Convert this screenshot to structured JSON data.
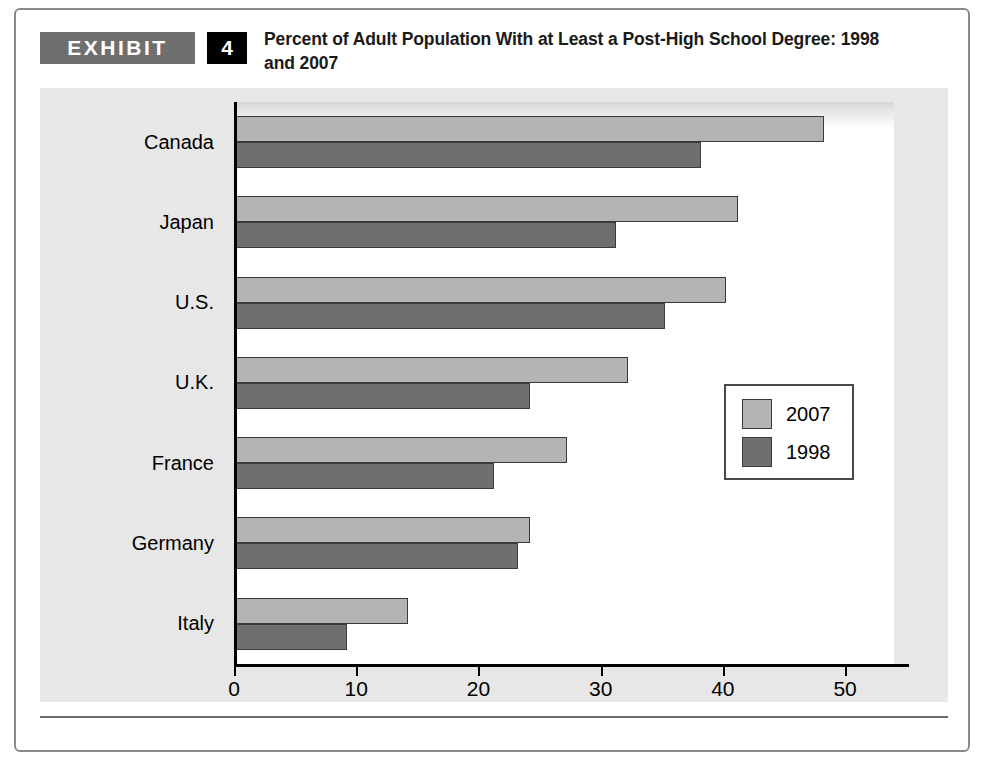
{
  "exhibit": {
    "label": "EXHIBIT",
    "number": "4",
    "title": "Percent of Adult Population With at Least a Post-High School Degree: 1998 and 2007"
  },
  "chart_data": {
    "type": "bar",
    "orientation": "horizontal",
    "title": "Percent of Adult Population With at Least a Post-High School Degree: 1998 and 2007",
    "xlabel": "",
    "ylabel": "",
    "xlim": [
      0,
      54
    ],
    "xticks": [
      0,
      10,
      20,
      30,
      40,
      50
    ],
    "xtick_labels": [
      "0",
      "10",
      "20",
      "30",
      "40",
      "50"
    ],
    "grid": false,
    "legend_position": "center-right",
    "categories": [
      "Canada",
      "Japan",
      "U.S.",
      "U.K.",
      "France",
      "Germany",
      "Italy"
    ],
    "series": [
      {
        "name": "2007",
        "color": "#b4b4b4",
        "values": [
          48,
          41,
          40,
          32,
          27,
          24,
          14
        ]
      },
      {
        "name": "1998",
        "color": "#6f6f6f",
        "values": [
          38,
          31,
          35,
          24,
          21,
          23,
          9
        ]
      }
    ]
  }
}
